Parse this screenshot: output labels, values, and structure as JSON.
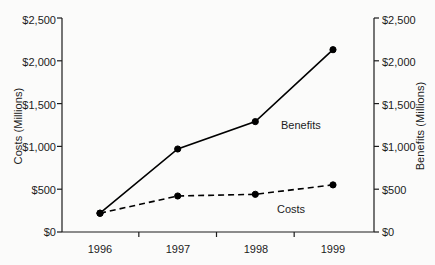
{
  "chart_data": {
    "type": "line",
    "title": "",
    "categories": [
      "1996",
      "1997",
      "1998",
      "1999"
    ],
    "x": [
      1996,
      1997,
      1998,
      1999
    ],
    "series": [
      {
        "name": "Benefits",
        "values": [
          220,
          970,
          1290,
          2130
        ],
        "style": "solid",
        "marker": "filled-circle",
        "color": "#000000",
        "axis": "right"
      },
      {
        "name": "Costs",
        "values": [
          220,
          420,
          440,
          550
        ],
        "style": "dashed",
        "marker": "filled-circle",
        "color": "#000000",
        "axis": "left"
      }
    ],
    "xlabel": "",
    "ylabel_left": "Costs (Millions)",
    "ylabel_right": "Benefits (Millions)",
    "ylim": [
      0,
      2500
    ],
    "y_ticks": [
      0,
      500,
      1000,
      1500,
      2000,
      2500
    ],
    "y_tick_labels_left": [
      "$0",
      "$500",
      "$1,000",
      "$1,500",
      "$2,000",
      "$2,500"
    ],
    "y_tick_labels_right": [
      "$0",
      "$500",
      "$1,000",
      "$1,500",
      "$2,000",
      "$2,500"
    ],
    "grid": false,
    "legend": "inline-annotations",
    "annotations": [
      {
        "text": "Benefits",
        "near_point": {
          "x": 1998,
          "y": 1290
        }
      },
      {
        "text": "Costs",
        "near_point": {
          "x": 1998,
          "y": 440
        }
      }
    ]
  },
  "axes": {
    "left": {
      "title": "Costs (Millions)",
      "ticks": [
        {
          "label": "$2,500"
        },
        {
          "label": "$2,000"
        },
        {
          "label": "$1,500"
        },
        {
          "label": "$1,000"
        },
        {
          "label": "$500"
        },
        {
          "label": "$0"
        }
      ]
    },
    "right": {
      "title": "Benefits (Millions)",
      "ticks": [
        {
          "label": "$2,500"
        },
        {
          "label": "$2,000"
        },
        {
          "label": "$1,500"
        },
        {
          "label": "$1,000"
        },
        {
          "label": "$500"
        },
        {
          "label": "$0"
        }
      ]
    },
    "bottom": {
      "ticks": [
        {
          "label": "1996"
        },
        {
          "label": "1997"
        },
        {
          "label": "1998"
        },
        {
          "label": "1999"
        }
      ]
    }
  },
  "series_labels": {
    "benefits": "Benefits",
    "costs": "Costs"
  }
}
